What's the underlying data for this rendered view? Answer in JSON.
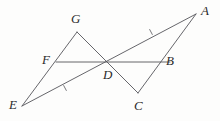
{
  "figure": {
    "background_color": "#fdfdfc",
    "stroke_color": "#55555a",
    "label_color": "#2b2b2b",
    "stroke_width": 0.9,
    "width": 220,
    "height": 121
  },
  "points": {
    "A": {
      "label": "A",
      "x": 196,
      "y": 14,
      "label_x": 201,
      "label_y": 4
    },
    "B": {
      "label": "B",
      "x": 163,
      "y": 62,
      "label_x": 166,
      "label_y": 54
    },
    "C": {
      "label": "C",
      "x": 138,
      "y": 93,
      "label_x": 134,
      "label_y": 99
    },
    "D": {
      "label": "D",
      "x": 107,
      "y": 62,
      "label_x": 103,
      "label_y": 68
    },
    "E": {
      "label": "E",
      "x": 22,
      "y": 106,
      "label_x": 9,
      "label_y": 98
    },
    "F": {
      "label": "F",
      "x": 56,
      "y": 62,
      "label_x": 42,
      "label_y": 53
    },
    "G": {
      "label": "G",
      "x": 77,
      "y": 32,
      "label_x": 71,
      "label_y": 12
    }
  },
  "segments": [
    {
      "name": "segment-E-A",
      "from": "E",
      "to": "A"
    },
    {
      "name": "segment-E-G",
      "from": "E",
      "to": "G"
    },
    {
      "name": "segment-G-C",
      "from": "G",
      "to": "C"
    },
    {
      "name": "segment-C-A",
      "from": "C",
      "to": "A"
    },
    {
      "name": "segment-F-B",
      "from": "F",
      "to": "B"
    }
  ],
  "tick_marks": [
    {
      "name": "tick-mark-ED",
      "on_segment": "segment-E-A",
      "x": 65,
      "y": 88,
      "count": 1
    },
    {
      "name": "tick-mark-DA",
      "on_segment": "segment-E-A",
      "x": 151,
      "y": 32,
      "count": 1
    }
  ],
  "labels_order": [
    "G",
    "A",
    "F",
    "D",
    "B",
    "E",
    "C"
  ]
}
